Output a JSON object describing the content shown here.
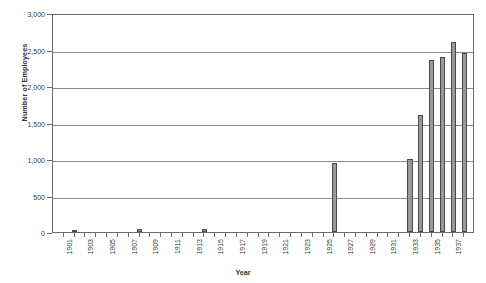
{
  "chart_data": {
    "type": "bar",
    "title": "",
    "xlabel": "Year",
    "ylabel": "Number of Employees",
    "ylim": [
      0,
      3000
    ],
    "ytick_labels": [
      "0",
      "500",
      "1,000",
      "1,500",
      "2,000",
      "2,500",
      "3,000"
    ],
    "ytick_values": [
      0,
      500,
      1000,
      1500,
      2000,
      2500,
      3000
    ],
    "grid": true,
    "legend": null,
    "xlim": [
      1901,
      1939
    ],
    "xtick_labels": [
      "1901",
      "1903",
      "1905",
      "1907",
      "1909",
      "1911",
      "1913",
      "1915",
      "1917",
      "1919",
      "1921",
      "1923",
      "1925",
      "1927",
      "1929",
      "1931",
      "1933",
      "1935",
      "1937"
    ],
    "categories": [
      1901,
      1902,
      1903,
      1904,
      1905,
      1906,
      1907,
      1908,
      1909,
      1910,
      1911,
      1912,
      1913,
      1914,
      1915,
      1916,
      1917,
      1918,
      1919,
      1920,
      1921,
      1922,
      1923,
      1924,
      1925,
      1926,
      1927,
      1928,
      1929,
      1930,
      1931,
      1932,
      1933,
      1934,
      1935,
      1936,
      1937,
      1938
    ],
    "values": [
      0,
      25,
      0,
      0,
      0,
      0,
      0,
      45,
      0,
      0,
      0,
      0,
      0,
      45,
      0,
      0,
      0,
      0,
      0,
      0,
      0,
      0,
      0,
      0,
      0,
      950,
      0,
      0,
      0,
      0,
      0,
      0,
      1000,
      1600,
      2350,
      2400,
      2600,
      2450
    ],
    "bar_color": "#9a9a9a",
    "bar_edge_color": "#4a4a4a",
    "grid_color": "#8a8a8a",
    "axis_color": "#6b6b6b"
  }
}
